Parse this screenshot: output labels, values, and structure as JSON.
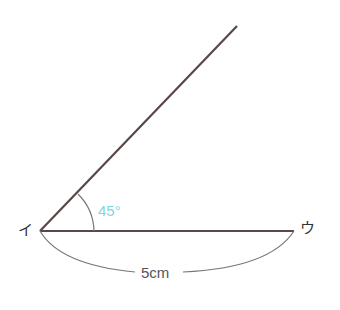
{
  "diagram": {
    "type": "angle-construction",
    "points": {
      "vertex": {
        "label": "イ",
        "x": 40,
        "y": 231
      },
      "end": {
        "label": "ウ",
        "x": 294,
        "y": 231
      },
      "ray_end": {
        "x": 237,
        "y": 26
      }
    },
    "angle": {
      "label": "45°",
      "color": "#7fd6e0"
    },
    "segment_length": {
      "label": "5cm"
    },
    "colors": {
      "line": "#5a4848",
      "arc": "#777777"
    }
  }
}
